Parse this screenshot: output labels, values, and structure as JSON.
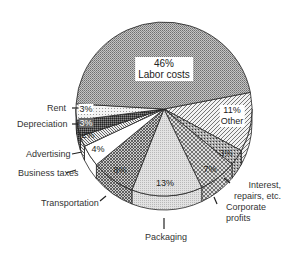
{
  "chart_data": {
    "type": "pie",
    "style": "3d-tilted",
    "title": "",
    "start_boundary_deg": -11,
    "slices": [
      {
        "name": "Other",
        "value": 11,
        "label": "11%",
        "sublabel": "Other",
        "fill": "diag"
      },
      {
        "name": "Interest, repairs, etc.",
        "value": 3,
        "label": "3%",
        "fill": "speckle"
      },
      {
        "name": "Corporate profits",
        "value": 7,
        "label": "7%",
        "fill": "cross"
      },
      {
        "name": "Packaging",
        "value": 13,
        "label": "13%",
        "fill": "lightdot"
      },
      {
        "name": "Transportation",
        "value": 8,
        "label": "8%",
        "fill": "cross2"
      },
      {
        "name": "Business taxes",
        "value": 4,
        "label": "4%",
        "fill": "white"
      },
      {
        "name": "Advertising",
        "value": 2,
        "label": "2%",
        "fill": "diag2"
      },
      {
        "name": "Depreciation",
        "value": 3,
        "label": "3%",
        "fill": "dark"
      },
      {
        "name": "Rent",
        "value": 3,
        "label": "3%",
        "fill": "dots"
      },
      {
        "name": "Labor costs",
        "value": 46,
        "label": "46%",
        "sublabel": "Labor costs",
        "fill": "gray"
      }
    ],
    "legend": "none (direct labels)"
  },
  "labels": {
    "labor_pct": "46%",
    "labor_name": "Labor costs",
    "other_pct": "11%",
    "other_name": "Other",
    "interest_pct": "3%",
    "corporate_pct": "7%",
    "packaging_pct": "13%",
    "transportation_pct": "8%",
    "business_pct": "4%",
    "advertising_pct": "2%",
    "depreciation_pct": "3%",
    "rent_pct": "3%",
    "rent": "Rent",
    "depreciation": "Depreciation",
    "advertising": "Advertising",
    "business_taxes": "Business taxes",
    "transportation": "Transportation",
    "packaging": "Packaging",
    "corporate_1": "Corporate",
    "corporate_2": "profits",
    "interest_1": "Interest,",
    "interest_2": "repairs, etc."
  }
}
